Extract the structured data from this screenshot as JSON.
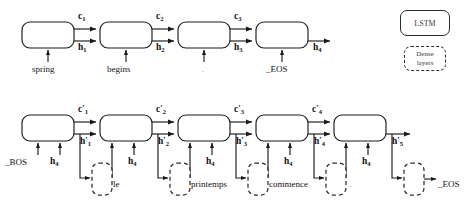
{
  "figure": {
    "background": "#ffffff",
    "stroke": "#1a1a1a",
    "dense_stroke": "#2b2b2b"
  },
  "legend": {
    "lstm_label": "LSTM",
    "dense_label_line1": "Dense",
    "dense_label_line2": "layers"
  },
  "encoder": {
    "inputs": [
      "spring",
      "begins",
      ".",
      "_EOS"
    ],
    "cell_states": [
      "c",
      "c",
      "c"
    ],
    "cell_state_subs": [
      "1",
      "2",
      "3"
    ],
    "hidden_states": [
      "h",
      "h",
      "h"
    ],
    "hidden_state_subs": [
      "1",
      "2",
      "3"
    ],
    "output_state": "h",
    "output_state_sub": "4"
  },
  "decoder": {
    "first_inputs": [
      "_BOS",
      "h"
    ],
    "first_input_sub": "4",
    "context_inputs": [
      "h",
      "h",
      "h",
      "h"
    ],
    "context_input_sub": "4",
    "cell_states": [
      "c",
      "c",
      "c",
      "c"
    ],
    "cell_state_subs": [
      "1",
      "2",
      "3",
      "4"
    ],
    "hidden_states": [
      "h",
      "h",
      "h",
      "h"
    ],
    "hidden_state_subs": [
      "1",
      "2",
      "3",
      "4"
    ],
    "final_hidden": "h",
    "final_hidden_sub": "5",
    "outputs": [
      "le",
      "printemps",
      "commence",
      ".",
      "_EOS"
    ]
  }
}
